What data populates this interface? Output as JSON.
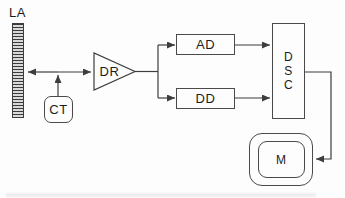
{
  "diagram": {
    "background": "#fdfdfd",
    "line_color": "#3d3d3d",
    "text_color": "#1c1c1c",
    "nodes": {
      "la": {
        "label": "LA",
        "shape": "striped-vertical-bar"
      },
      "ct": {
        "label": "CT",
        "shape": "rounded-rectangle"
      },
      "dr": {
        "label": "DR",
        "shape": "amplifier-triangle"
      },
      "ad": {
        "label": "AD",
        "shape": "rectangle"
      },
      "dd": {
        "label": "DD",
        "shape": "rectangle"
      },
      "dsc": {
        "label": "DSC",
        "letters": [
          "D",
          "S",
          "C"
        ],
        "shape": "tall-rectangle"
      },
      "m": {
        "label": "M",
        "shape": "monitor-double-rounded-rectangle"
      }
    },
    "edges": [
      {
        "from": "LA",
        "to": "DR",
        "style": "double-headed-arrow"
      },
      {
        "from": "CT",
        "to": "LA-DR-line",
        "style": "arrow"
      },
      {
        "from": "DR",
        "to": "AD",
        "style": "arrow"
      },
      {
        "from": "DR",
        "to": "DD",
        "style": "arrow"
      },
      {
        "from": "AD",
        "to": "DSC",
        "style": "arrow"
      },
      {
        "from": "DD",
        "to": "DSC",
        "style": "arrow"
      },
      {
        "from": "DSC",
        "to": "M",
        "style": "arrow"
      }
    ]
  }
}
